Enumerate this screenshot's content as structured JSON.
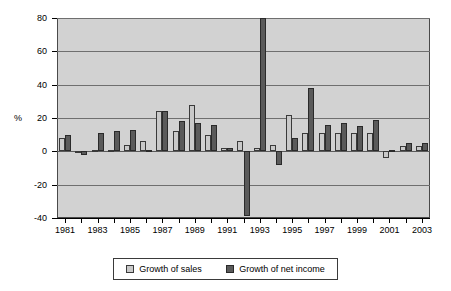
{
  "chart_data": {
    "type": "bar",
    "title": "",
    "subtitle": "",
    "xlabel": "",
    "ylabel": "%",
    "ylim": [
      -40,
      80
    ],
    "ytick_values": [
      80,
      60,
      40,
      20,
      0,
      -20,
      -40
    ],
    "ytick_labels": [
      "80",
      "60",
      "40",
      "20",
      "0",
      "-20",
      "-40"
    ],
    "grid": true,
    "grid_axis": "y",
    "legend_position": "bottom",
    "categories": [
      "1981",
      "1982",
      "1983",
      "1984",
      "1985",
      "1986",
      "1987",
      "1988",
      "1989",
      "1990",
      "1991",
      "1992",
      "1993",
      "1994",
      "1995",
      "1996",
      "1997",
      "1998",
      "1999",
      "2000",
      "2001",
      "2002",
      "2003"
    ],
    "xtick_labels": [
      "1981",
      "1983",
      "1985",
      "1987",
      "1989",
      "1991",
      "1993",
      "1995",
      "1997",
      "1999",
      "2001",
      "2003"
    ],
    "series": [
      {
        "name": "Growth of sales",
        "color": "#c9c9c9",
        "values": [
          8,
          -1,
          1,
          1,
          4,
          6,
          24,
          12,
          28,
          10,
          2,
          6,
          2,
          4,
          22,
          11,
          11,
          11,
          11,
          11,
          -4,
          3,
          3
        ]
      },
      {
        "name": "Growth of net income",
        "color": "#5a5a5a",
        "values": [
          10,
          -2,
          11,
          12,
          13,
          1,
          24,
          18,
          17,
          16,
          2,
          -39,
          80,
          -8,
          8,
          38,
          16,
          17,
          15,
          19,
          1,
          5,
          5
        ]
      }
    ]
  },
  "legend": {
    "entries": [
      {
        "label": "Growth of sales"
      },
      {
        "label": "Growth of net income"
      }
    ]
  }
}
